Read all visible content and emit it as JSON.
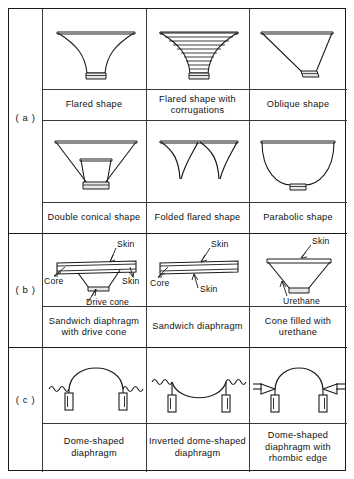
{
  "figure": {
    "sections": [
      {
        "key": "a",
        "label": "( a )"
      },
      {
        "key": "b",
        "label": "( b )"
      },
      {
        "key": "c",
        "label": "( c )"
      }
    ]
  },
  "section_a": {
    "row1": [
      {
        "caption": "Flared shape",
        "shape": "flared-cone"
      },
      {
        "caption": "Flared shape with corrugations",
        "shape": "flared-cone-corrugated"
      },
      {
        "caption": "Oblique shape",
        "shape": "oblique-cone"
      }
    ],
    "row2": [
      {
        "caption": "Double  conical shape",
        "shape": "double-conical-cone"
      },
      {
        "caption": "Folded flared shape",
        "shape": "folded-flared-cone"
      },
      {
        "caption": "Parabolic shape",
        "shape": "parabolic-bowl"
      }
    ]
  },
  "section_b": {
    "items": [
      {
        "caption": "Sandwich diaphragm with drive cone",
        "shape": "sandwich-panel-with-drive-cone",
        "annotations": [
          "Skin",
          "Core",
          "Skin",
          "Drive cone"
        ]
      },
      {
        "caption": "Sandwich  diaphragm",
        "shape": "sandwich-panel",
        "annotations": [
          "Skin",
          "Core",
          "Skin"
        ]
      },
      {
        "caption": "Cone filled with urethane",
        "shape": "cone-filled-urethane",
        "annotations": [
          "Skin",
          "Urethane"
        ]
      }
    ]
  },
  "section_c": {
    "items": [
      {
        "caption": "Dome-shaped diaphragm",
        "shape": "dome"
      },
      {
        "caption": "Inverted dome-shaped diaphragm",
        "shape": "inverted-dome"
      },
      {
        "caption": "Dome-shaped diaphragm with rhombic edge",
        "shape": "dome-rhombic-edge"
      }
    ]
  },
  "style": {
    "line_color": "#1a1a1a",
    "grid_color": "#3a3a3a",
    "fill_color": "#ffffff",
    "shade_color": "#d9d9d9",
    "background": "#ffffff"
  }
}
